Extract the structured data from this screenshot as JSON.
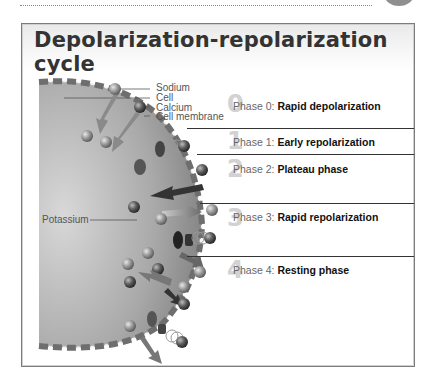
{
  "figure": {
    "title": "Depolarization-repolarization cycle",
    "labels": {
      "sodium": "Sodium",
      "cell": "Cell",
      "calcium": "Calcium",
      "cell_membrane": "Cell membrane",
      "potassium": "Potassium"
    },
    "phases": [
      {
        "number": "0",
        "prefix": "Phase 0:",
        "name": "Rapid depolarization"
      },
      {
        "number": "1",
        "prefix": "Phase 1:",
        "name": "Early repolarization"
      },
      {
        "number": "2",
        "prefix": "Phase 2:",
        "name": "Plateau phase"
      },
      {
        "number": "3",
        "prefix": "Phase 3:",
        "name": "Rapid repolarization"
      },
      {
        "number": "4",
        "prefix": "Phase 4:",
        "name": "Resting phase"
      }
    ]
  }
}
